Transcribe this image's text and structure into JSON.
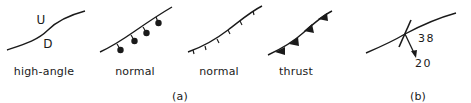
{
  "panel_a": {
    "caption": "(a)",
    "faults": [
      {
        "type": "high-angle",
        "label": "high-angle",
        "upthrown_label": "U",
        "downthrown_label": "D"
      },
      {
        "type": "normal-ball",
        "label": "normal"
      },
      {
        "type": "normal-hachure",
        "label": "normal"
      },
      {
        "type": "thrust",
        "label": "thrust"
      }
    ]
  },
  "panel_b": {
    "caption": "(b)",
    "dip_value": "38",
    "plunge_value": "20"
  },
  "colors": {
    "ink": "#1a1a1a",
    "background": "#ffffff"
  }
}
